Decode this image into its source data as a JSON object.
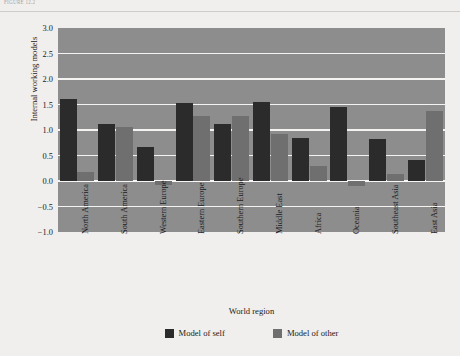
{
  "figure": {
    "caption": "FIGURE 12.2",
    "ylabel": "Internal working models",
    "xlabel": "World region"
  },
  "legend": {
    "items": [
      {
        "label": "Model of self",
        "color": "#2b2b2b",
        "key": "self-swatch"
      },
      {
        "label": "Model of other",
        "color": "#6f6f6f",
        "key": "other-swatch"
      }
    ]
  },
  "axis": {
    "yticks": [
      "3.0",
      "2.5",
      "2.0",
      "1.5",
      "1.0",
      "0.5",
      "0.0",
      "-0.5",
      "-1.0"
    ]
  },
  "chart_data": {
    "type": "bar",
    "title": "",
    "xlabel": "World region",
    "ylabel": "Internal working models",
    "ylim": [
      -1.0,
      3.0
    ],
    "ytick_step": 0.5,
    "grid": true,
    "legend_position": "bottom",
    "categories": [
      "North America",
      "South America",
      "Western Europe",
      "Eastern Europe",
      "Southern Europe",
      "Middle East",
      "Africa",
      "Oceania",
      "Southeast Asia",
      "East Asia"
    ],
    "series": [
      {
        "name": "Model of self",
        "color": "#2b2b2b",
        "values": [
          1.6,
          1.12,
          0.67,
          1.53,
          1.12,
          1.55,
          0.85,
          1.45,
          0.82,
          0.42
        ]
      },
      {
        "name": "Model of other",
        "color": "#6f6f6f",
        "values": [
          0.17,
          1.05,
          -0.08,
          1.27,
          1.27,
          0.93,
          0.3,
          -0.1,
          0.13,
          1.37
        ]
      }
    ]
  }
}
